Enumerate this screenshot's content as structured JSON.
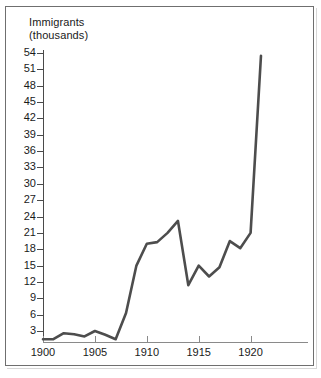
{
  "figure": {
    "axis_title": "Immigrants\n(thousands)",
    "frame_color": "#6f6f6f",
    "line_color": "#4d4d4d",
    "axis_color": "#4a4a4a",
    "text_color": "#1a1a1a"
  },
  "chart_data": {
    "type": "line",
    "title": "",
    "subtitle": "",
    "xlabel": "",
    "ylabel": "Immigrants (thousands)",
    "grid": false,
    "legend": "none",
    "xlim": [
      1900,
      1921
    ],
    "ylim": [
      0,
      55.5
    ],
    "yticks": [
      3,
      6,
      9,
      12,
      15,
      18,
      21,
      24,
      27,
      30,
      33,
      36,
      39,
      42,
      45,
      48,
      51,
      54
    ],
    "ytick_labels": [
      "3",
      "6",
      "9",
      "12",
      "15",
      "18",
      "21",
      "24",
      "27",
      "30",
      "33",
      "36",
      "39",
      "42",
      "45",
      "48",
      "51",
      "54"
    ],
    "xticks": [
      1900,
      1905,
      1910,
      1915,
      1920
    ],
    "xtick_labels": [
      "1900",
      "1905",
      "1910",
      "1915",
      "1920"
    ],
    "x": [
      1900,
      1901,
      1902,
      1903,
      1904,
      1905,
      1906,
      1907,
      1908,
      1909,
      1910,
      1911,
      1912,
      1913,
      1914,
      1915,
      1916,
      1917,
      1918,
      1919,
      1920,
      1921
    ],
    "values": [
      1.5,
      1.5,
      2.6,
      2.4,
      2.0,
      3.0,
      2.3,
      1.5,
      6.3,
      15.0,
      19.0,
      19.3,
      21.0,
      23.2,
      11.4,
      15.0,
      13.0,
      14.7,
      19.5,
      18.2,
      21.0,
      53.5
    ],
    "series": [
      {
        "name": "Immigrants (thousands)",
        "values": [
          1.5,
          1.5,
          2.6,
          2.4,
          2.0,
          3.0,
          2.3,
          1.5,
          6.3,
          15.0,
          19.0,
          19.3,
          21.0,
          23.2,
          11.4,
          15.0,
          13.0,
          14.7,
          19.5,
          18.2,
          21.0,
          53.5
        ]
      }
    ]
  }
}
